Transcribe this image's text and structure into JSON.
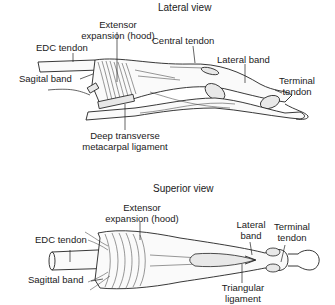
{
  "lateral_view": {
    "title": "Lateral view",
    "labels": {
      "extensor_expansion_line1": "Extensor",
      "extensor_expansion_line2": "expansion (hood)",
      "edc_tendon": "EDC tendon",
      "central_tendon": "Central tendon",
      "lateral_band": "Lateral band",
      "sagittal_band": "Sagital band",
      "terminal_tendon_line1": "Terminal",
      "terminal_tendon_line2": "tendon",
      "deep_transverse_line1": "Deep transverse",
      "deep_transverse_line2": "metacarpal ligament"
    }
  },
  "superior_view": {
    "title": "Superior view",
    "labels": {
      "extensor_expansion_line1": "Extensor",
      "extensor_expansion_line2": "expansion (hood)",
      "edc_tendon": "EDC tendon",
      "lateral_band_line1": "Lateral",
      "lateral_band_line2": "band",
      "terminal_tendon_line1": "Terminal",
      "terminal_tendon_line2": "tendon",
      "sagittal_band": "Sagittal band",
      "triangular_ligament_line1": "Triangular",
      "triangular_ligament_line2": "ligament"
    }
  }
}
